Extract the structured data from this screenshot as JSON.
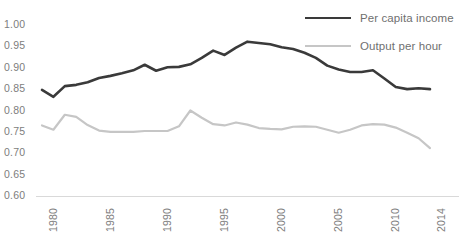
{
  "chart_data": {
    "type": "line",
    "title": "",
    "subtitle": "",
    "xlabel": "",
    "ylabel": "",
    "x": [
      1980,
      1981,
      1982,
      1983,
      1984,
      1985,
      1986,
      1987,
      1988,
      1989,
      1990,
      1991,
      1992,
      1993,
      1994,
      1995,
      1996,
      1997,
      1998,
      1999,
      2000,
      2001,
      2002,
      2003,
      2004,
      2005,
      2006,
      2007,
      2008,
      2009,
      2010,
      2011,
      2012,
      2013,
      2014
    ],
    "xlim": [
      1980,
      2014
    ],
    "ylim": [
      0.6,
      1.0
    ],
    "yticks": [
      0.6,
      0.65,
      0.7,
      0.75,
      0.8,
      0.85,
      0.9,
      0.95,
      1.0
    ],
    "ytick_labels": [
      "0.60",
      "0.65",
      "0.70",
      "0.75",
      "0.80",
      "0.85",
      "0.90",
      "0.95",
      "1.00"
    ],
    "xticks": [
      1980,
      1985,
      1990,
      1995,
      2000,
      2005,
      2010,
      2014
    ],
    "xtick_labels": [
      "1980",
      "1985",
      "1990",
      "1995",
      "2000",
      "2005",
      "2010",
      "2014"
    ],
    "grid": false,
    "legend_position": "top-right",
    "series": [
      {
        "name": "Per capita income",
        "color": "#3a3a3a",
        "width": 2.6,
        "values": [
          0.848,
          0.832,
          0.857,
          0.86,
          0.866,
          0.876,
          0.881,
          0.887,
          0.894,
          0.907,
          0.893,
          0.901,
          0.902,
          0.908,
          0.923,
          0.94,
          0.93,
          0.947,
          0.961,
          0.958,
          0.955,
          0.948,
          0.944,
          0.935,
          0.923,
          0.905,
          0.896,
          0.89,
          0.89,
          0.894,
          0.875,
          0.855,
          0.85,
          0.852,
          0.85
        ]
      },
      {
        "name": "Output per hour",
        "color": "#c6c6c6",
        "width": 2.2,
        "values": [
          0.765,
          0.755,
          0.79,
          0.785,
          0.766,
          0.753,
          0.75,
          0.75,
          0.75,
          0.752,
          0.752,
          0.752,
          0.763,
          0.8,
          0.783,
          0.768,
          0.765,
          0.772,
          0.767,
          0.759,
          0.757,
          0.756,
          0.762,
          0.763,
          0.762,
          0.755,
          0.748,
          0.755,
          0.765,
          0.768,
          0.767,
          0.76,
          0.748,
          0.735,
          0.712
        ]
      }
    ]
  },
  "legend": {
    "items": [
      {
        "label": "Per capita income",
        "style": "dark"
      },
      {
        "label": "Output per hour",
        "style": "light"
      }
    ]
  },
  "colors": {
    "series_dark": "#3a3a3a",
    "series_light": "#c6c6c6",
    "tick_text": "#7d7d7d",
    "legend_text": "#6f6f6f",
    "axis": "#d9d9d9",
    "background": "#ffffff"
  }
}
